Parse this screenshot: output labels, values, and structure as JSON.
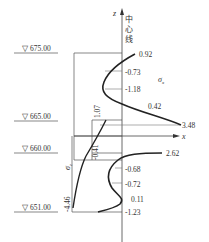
{
  "elevations": [
    {
      "label": "675.00",
      "symbol": "▽"
    },
    {
      "label": "665.00",
      "symbol": "▽"
    },
    {
      "label": "660.00",
      "symbol": "▽"
    },
    {
      "label": "651.00",
      "symbol": "▽"
    }
  ],
  "axes": {
    "z_label": "z",
    "x_label": "x",
    "center_line_label_chars": [
      "中",
      "心",
      "线"
    ]
  },
  "upper_section": {
    "stress_label": "σ",
    "stress_subscript": "x",
    "values": [
      "0.92",
      "-0.73",
      "-1.18",
      "0.42",
      "3.48"
    ],
    "left_value": "1.07"
  },
  "lower_section": {
    "stress_label": "σ",
    "stress_subscript": "z",
    "values": [
      "2.62",
      "-0.68",
      "-0.72",
      "0.11",
      "-1.23"
    ],
    "left_values": [
      "-0.41",
      "-4.46"
    ]
  },
  "colors": {
    "line": "#222222",
    "thin_line": "#555555",
    "text": "#333333"
  }
}
